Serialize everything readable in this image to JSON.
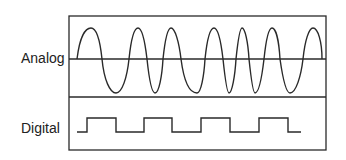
{
  "labels": {
    "analog": "Analog",
    "digital": "Digital"
  },
  "colors": {
    "stroke": "#2a2a2a",
    "background": "#ffffff"
  },
  "diagram": {
    "frame": {
      "x": 69,
      "y": 16,
      "width": 257,
      "height": 134,
      "divider_y": 97
    },
    "analog": {
      "baseline_y": 59,
      "path": "M77,59 C80,35 86,28 91,28 C97,28 100,40 102,59 C104,80 110,93 116,93 C122,93 127,78 129,59 C131,40 134,28 138,28 C142,28 145,42 147,59 C149,78 152,93 155,93 C159,93 162,76 163,59 C165,40 168,28 171,28 C175,28 179,42 181,59 C184,82 190,93 197,93 C201,93 204,76 205,59 C207,40 210,28 214,28 C218,28 221,42 223,59 C225,78 227,93 229,93 C232,93 235,76 236,59 C238,40 240,28 242,28 C245,28 248,42 249,59 C251,78 253,93 255,93 C259,93 262,76 264,59 C266,40 269,28 272,28 C276,28 279,42 280,59 C283,80 286,93 290,93 C296,93 301,76 303,59 C305,40 309,28 313,28 C318,28 322,42 322,59"
    },
    "digital": {
      "path": "M77,132 L87,132 L87,118 L116,118 L116,132 L144,132 L144,118 L172,118 L172,132 L201,132 L201,118 L230,118 L230,132 L259,132 L259,118 L288,118 L288,132 L301,132"
    }
  }
}
